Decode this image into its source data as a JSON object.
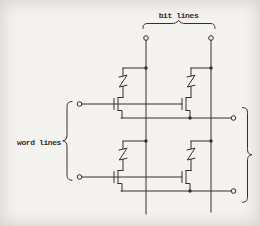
{
  "labels": {
    "bit_lines": "bit lines",
    "word_lines": "word lines"
  },
  "colors": {
    "ink": "#33302b",
    "paper": "#f5f3ef"
  },
  "schematic": {
    "kind": "MOS memory cell array",
    "grid": "2 x 2",
    "bit_line_count": 2,
    "word_line_count": 2,
    "cell_count": 4,
    "cell_elements": [
      "MOS transistor",
      "zigzag fuse/load element"
    ],
    "terminals": {
      "top_bit_line": 2,
      "left_word_line": 2,
      "right_source_line": 2
    }
  }
}
